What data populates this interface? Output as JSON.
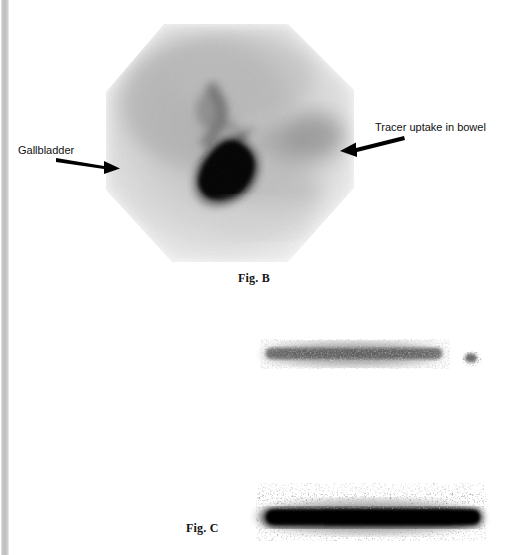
{
  "figure": {
    "kind": "nuclear-medicine-scintigraphy-plate",
    "background_color": "#ffffff",
    "scan_edge_color": "#c6c6c6"
  },
  "panels": [
    {
      "id": "panel-b",
      "caption": "Fig. B",
      "caption_x": 238,
      "caption_y": 277,
      "modality_note": "hepatobiliary scintigram, hexagonal field of view",
      "annotations": [
        {
          "id": "gallbladder",
          "label": "Gallbladder",
          "label_x": 18,
          "label_y": 144,
          "arrow_direction": "right",
          "arrow_from_x": 58,
          "arrow_from_y": 158,
          "arrow_to_x": 118,
          "arrow_to_y": 168
        },
        {
          "id": "bowel",
          "label": "Tracer uptake in bowel",
          "label_x": 375,
          "label_y": 121,
          "arrow_direction": "left",
          "arrow_from_x": 402,
          "arrow_from_y": 140,
          "arrow_to_x": 341,
          "arrow_to_y": 155
        }
      ],
      "features": [
        {
          "name": "gallbladder-hot-spot",
          "intensity": "very-high",
          "shape": "teardrop"
        },
        {
          "name": "common-bile-duct",
          "intensity": "moderate",
          "shape": "branching"
        },
        {
          "name": "bowel-uptake",
          "intensity": "low-moderate",
          "shape": "diffuse"
        }
      ]
    },
    {
      "id": "panel-c",
      "caption": "Fig. C",
      "caption_x": 186,
      "caption_y": 527,
      "modality_note": "linear scintigraphic bands",
      "annotations": [],
      "features": [
        {
          "name": "upper-band",
          "intensity": "moderate",
          "shape": "horizontal-band"
        },
        {
          "name": "upper-band-satellite",
          "intensity": "low",
          "shape": "small-blob"
        },
        {
          "name": "lower-band",
          "intensity": "very-high",
          "shape": "horizontal-band"
        }
      ]
    }
  ]
}
